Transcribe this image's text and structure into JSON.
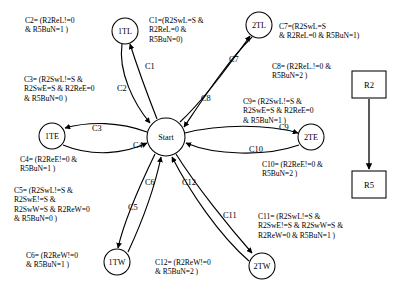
{
  "diagram": {
    "type": "state-machine",
    "nodes": [
      {
        "id": "start",
        "label": "Start",
        "shape": "circle",
        "cx": 166,
        "cy": 137,
        "r": 19
      },
      {
        "id": "1tl",
        "label": "1TL",
        "shape": "circle",
        "cx": 125,
        "cy": 31,
        "r": 13
      },
      {
        "id": "2tl",
        "label": "2TL",
        "shape": "circle",
        "cx": 259,
        "cy": 25,
        "r": 13
      },
      {
        "id": "1te",
        "label": "1TE",
        "shape": "circle",
        "cx": 52,
        "cy": 136,
        "r": 13
      },
      {
        "id": "2te",
        "label": "2TE",
        "shape": "circle",
        "cx": 311,
        "cy": 137,
        "r": 13
      },
      {
        "id": "1tw",
        "label": "1TW",
        "shape": "circle",
        "cx": 117,
        "cy": 262,
        "r": 13
      },
      {
        "id": "2tw",
        "label": "2TW",
        "shape": "circle",
        "cx": 262,
        "cy": 266,
        "r": 13
      },
      {
        "id": "r2",
        "label": "R2",
        "shape": "rect",
        "x": 352,
        "y": 71,
        "w": 34,
        "h": 27
      },
      {
        "id": "r5",
        "label": "R5",
        "shape": "rect",
        "x": 352,
        "y": 171,
        "w": 34,
        "h": 27
      }
    ],
    "edge_labels": [
      {
        "id": "e1",
        "text": "C1",
        "x": 145,
        "y": 69
      },
      {
        "id": "e2",
        "text": "C2",
        "x": 117,
        "y": 91
      },
      {
        "id": "e3",
        "text": "C3",
        "x": 92,
        "y": 131
      },
      {
        "id": "e4",
        "text": "C4",
        "x": 133,
        "y": 148
      },
      {
        "id": "e5",
        "text": "C5",
        "x": 128,
        "y": 210
      },
      {
        "id": "e6",
        "text": "C6",
        "x": 145,
        "y": 185
      },
      {
        "id": "e7",
        "text": "C7",
        "x": 229,
        "y": 62
      },
      {
        "id": "e8",
        "text": "C8",
        "x": 201,
        "y": 101
      },
      {
        "id": "e9",
        "text": "C9",
        "x": 279,
        "y": 130
      },
      {
        "id": "e10",
        "text": "C10",
        "x": 249,
        "y": 152
      },
      {
        "id": "e11",
        "text": "C11",
        "x": 223,
        "y": 218
      },
      {
        "id": "e12",
        "text": "C12",
        "x": 182,
        "y": 185
      }
    ],
    "conditions": [
      {
        "id": "c1",
        "lines": [
          "C1=(R2SwL=S &",
          "R2ReL=0 &",
          "R5BuN=0)"
        ],
        "x": 149,
        "y": 16,
        "align": "left"
      },
      {
        "id": "c2",
        "lines": [
          "C2= (R2ReL!=0",
          "& R5BuN=1 )"
        ],
        "x": 25,
        "y": 16,
        "align": "left"
      },
      {
        "id": "c3",
        "lines": [
          "C3= (R2SwL!=S &",
          "R2SwE=S & R2ReE=0",
          "& R5BuN=0 )"
        ],
        "x": 24,
        "y": 75,
        "align": "left"
      },
      {
        "id": "c4",
        "lines": [
          "C4= (R2ReE!=0 &",
          "R5BuN=1 )"
        ],
        "x": 20,
        "y": 155,
        "align": "left"
      },
      {
        "id": "c5",
        "lines": [
          "C5= (R2SwL!=S &",
          "R2SwE!=S &",
          "R2SwW=S & R2ReW=0",
          "& R5BuN=0 )"
        ],
        "x": 14,
        "y": 186,
        "align": "left"
      },
      {
        "id": "c6",
        "lines": [
          "C6= (R2ReW!=0",
          "& R5BuN=1 )"
        ],
        "x": 26,
        "y": 251,
        "align": "left"
      },
      {
        "id": "c7",
        "lines": [
          "C7=(R2SwL=S",
          "& R2ReL=0 & R5BuN=1)"
        ],
        "x": 279,
        "y": 22,
        "align": "left"
      },
      {
        "id": "c8",
        "lines": [
          "C8= (R2ReL.!=0 &",
          "R5BuN=2 )"
        ],
        "x": 272,
        "y": 62,
        "align": "left"
      },
      {
        "id": "c9",
        "lines": [
          "C9= (R2SwL!=S &",
          "R2SwE=S & R2ReE=0",
          "& R5BuN=1 )"
        ],
        "x": 243,
        "y": 97,
        "align": "left"
      },
      {
        "id": "c10",
        "lines": [
          "C10= (R2ReE!=0 &",
          "R5BuN=2 )"
        ],
        "x": 262,
        "y": 160,
        "align": "left"
      },
      {
        "id": "c11",
        "lines": [
          "C11= (R2SwL!=S &",
          "R2SwE!=S & R2SwW=S &",
          "R2ReW=0 & R5BuN=1 )"
        ],
        "x": 258,
        "y": 212,
        "align": "left"
      },
      {
        "id": "c12",
        "lines": [
          "C12= (R2ReW!=0",
          "& R5BuN=2 )"
        ],
        "x": 155,
        "y": 258,
        "align": "left"
      }
    ],
    "colors": {
      "stroke": "#000000",
      "background": "#ffffff",
      "node_fill": "#ffffff"
    }
  }
}
